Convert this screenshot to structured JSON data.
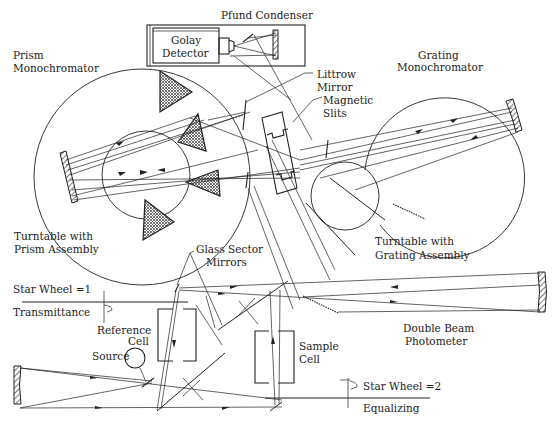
{
  "diagram": {
    "labels": {
      "pfund_condenser": "Pfund Condenser",
      "golay_detector_line1": "Golay",
      "golay_detector_line2": "Detector",
      "prism_mono_line1": "Prism",
      "prism_mono_line2": "Monochromator",
      "grating_mono_line1": "Grating",
      "grating_mono_line2": "Monochromator",
      "littrow_line1": "Littrow",
      "littrow_line2": "Mirror",
      "slits_line1": "Magnetic",
      "slits_line2": "Slits",
      "turntable_prism_line1": "Turntable with",
      "turntable_prism_line2": "Prism Assembly",
      "turntable_grating_line1": "Turntable with",
      "turntable_grating_line2": "Grating Assembly",
      "glass_sector_line1": "Glass Sector",
      "glass_sector_line2": "Mirrors",
      "star_wheel_1": "Star Wheel =1",
      "transmittance": "Transmittance",
      "reference_cell_line1": "Reference",
      "reference_cell_line2": "Cell",
      "source": "Source",
      "sample_cell_line1": "Sample",
      "sample_cell_line2": "Cell",
      "double_beam_line1": "Double Beam",
      "double_beam_line2": "Photometer",
      "star_wheel_2": "Star Wheel =2",
      "equalizing": "Equalizing"
    }
  }
}
